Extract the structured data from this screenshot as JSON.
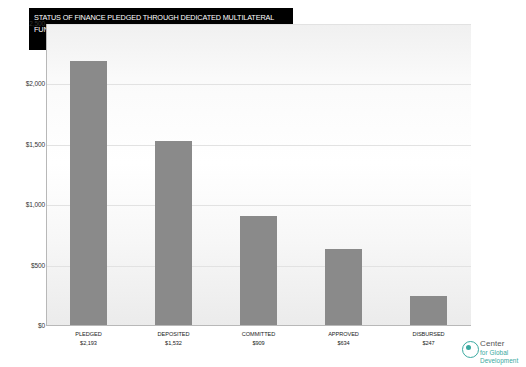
{
  "title": {
    "line1": "STATUS OF FINANCE PLEDGED THROUGH DEDICATED MULTILATERAL",
    "line2": "FUNDS, 2006-2014 (MILLIONS OF DOLLARS)"
  },
  "logo": {
    "line1": "Center",
    "line2": "for Global",
    "line3": "Development"
  },
  "chart_data": {
    "type": "bar",
    "title": "STATUS OF FINANCE PLEDGED THROUGH DEDICATED MULTILATERAL FUNDS, 2006-2014 (MILLIONS OF DOLLARS)",
    "xlabel": "",
    "ylabel": "",
    "categories": [
      "PLEDGED",
      "DEPOSITED",
      "COMMITTED",
      "APPROVED",
      "DISBURSED"
    ],
    "values": [
      2193,
      1532,
      909,
      634,
      247
    ],
    "value_labels": [
      "$2,193",
      "$1,532",
      "$909",
      "$634",
      "$247"
    ],
    "ylim": [
      0,
      2500
    ],
    "yticks": [
      0,
      500,
      1000,
      1500,
      2000,
      2500
    ],
    "ytick_labels": [
      "$0",
      "$500",
      "$1,000",
      "$1,500",
      "$2,000",
      "2,500"
    ],
    "grid": true,
    "legend": false,
    "bar_color": "#8a8a8a"
  }
}
